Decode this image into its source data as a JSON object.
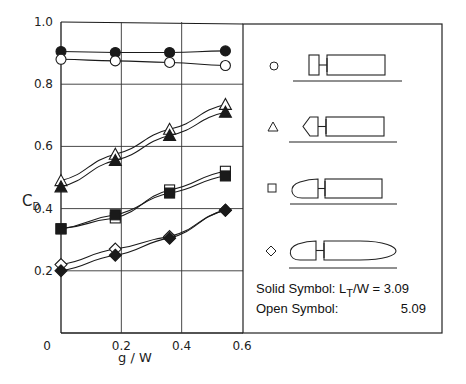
{
  "chart_data": {
    "type": "line",
    "title": "",
    "xlabel": "g / W",
    "ylabel": "C_D",
    "ylabel_main": "C",
    "ylabel_sub": "D",
    "xlim": [
      0,
      0.6
    ],
    "ylim": [
      0,
      1.0
    ],
    "grid": true,
    "x_ticks": [
      "0",
      "0.2",
      "0.4",
      "0.6"
    ],
    "y_ticks": [
      "0.2",
      "0.4",
      "0.6",
      "0.8",
      "1.0"
    ],
    "x": [
      0,
      0.18,
      0.36,
      0.545
    ],
    "series": [
      {
        "name": "Circle (flat disk) solid L_T/W=3.09",
        "marker": "circle",
        "filled": true,
        "values": [
          0.905,
          0.902,
          0.902,
          0.907
        ]
      },
      {
        "name": "Circle (flat disk) open L_T/W=5.09",
        "marker": "circle",
        "filled": false,
        "values": [
          0.88,
          0.875,
          0.87,
          0.86
        ]
      },
      {
        "name": "Triangle (pointed nose) open L_T/W=5.09",
        "marker": "triangle",
        "filled": false,
        "values": [
          0.49,
          0.575,
          0.655,
          0.735
        ]
      },
      {
        "name": "Triangle (pointed nose) solid L_T/W=3.09",
        "marker": "triangle",
        "filled": true,
        "values": [
          0.47,
          0.555,
          0.635,
          0.71
        ]
      },
      {
        "name": "Square (bullet nose) open L_T/W=5.09",
        "marker": "square",
        "filled": false,
        "values": [
          0.335,
          0.37,
          0.46,
          0.52
        ]
      },
      {
        "name": "Square (bullet nose) solid L_T/W=3.09",
        "marker": "square",
        "filled": true,
        "values": [
          0.335,
          0.38,
          0.45,
          0.505
        ]
      },
      {
        "name": "Diamond (streamlined) open L_T/W=5.09",
        "marker": "diamond",
        "filled": false,
        "values": [
          0.22,
          0.27,
          0.31,
          0.395
        ]
      },
      {
        "name": "Diamond (streamlined) solid L_T/W=3.09",
        "marker": "diamond",
        "filled": true,
        "values": [
          0.2,
          0.25,
          0.305,
          0.395
        ]
      }
    ],
    "legend": {
      "position": "right panel",
      "entries": [
        {
          "symbol": "circle",
          "shape": "flat-front disk + box body"
        },
        {
          "symbol": "triangle",
          "shape": "pointed nose + box body"
        },
        {
          "symbol": "square",
          "shape": "bullet nose + box body"
        },
        {
          "symbol": "diamond",
          "shape": "bullet nose + streamlined tail"
        }
      ],
      "solid_label": "Solid Symbol:",
      "solid_param": "L",
      "solid_param_sub": "T",
      "solid_param_rest": "/W = 3.09",
      "open_label": "Open Symbol:",
      "open_value": "5.09"
    }
  },
  "colors": {
    "ink": "#1a1a1a",
    "grid": "#333333",
    "background": "#ffffff"
  }
}
